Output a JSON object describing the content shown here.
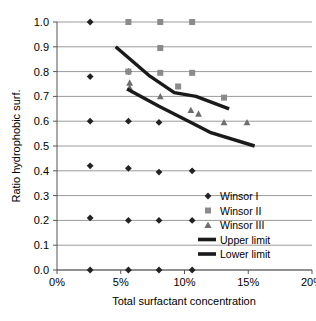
{
  "chart_data": {
    "type": "scatter",
    "title": "",
    "xlabel": "Total surfactant concentration",
    "ylabel": "Ratio hydrophobic surf.",
    "xlim": [
      0,
      20
    ],
    "ylim": [
      0.0,
      1.0
    ],
    "xticks": [
      "0%",
      "5%",
      "10%",
      "15%",
      "20%"
    ],
    "xtick_values": [
      0,
      5,
      10,
      15,
      20
    ],
    "yticks": [
      "0.0",
      "0.1",
      "0.2",
      "0.3",
      "0.4",
      "0.5",
      "0.6",
      "0.7",
      "0.8",
      "0.9",
      "1.0"
    ],
    "ytick_values": [
      0.0,
      0.1,
      0.2,
      0.3,
      0.4,
      0.5,
      0.6,
      0.7,
      0.8,
      0.9,
      1.0
    ],
    "grid": true,
    "legend_position": "inside-bottom-right",
    "series": [
      {
        "name": "Winsor I",
        "marker": "diamond",
        "color": "#222222",
        "points": [
          [
            2.6,
            1.0
          ],
          [
            2.6,
            0.78
          ],
          [
            2.6,
            0.6
          ],
          [
            2.6,
            0.42
          ],
          [
            2.6,
            0.21
          ],
          [
            2.6,
            0.0
          ],
          [
            5.6,
            0.8
          ],
          [
            5.6,
            0.6
          ],
          [
            5.6,
            0.41
          ],
          [
            5.6,
            0.2
          ],
          [
            5.6,
            0.0
          ],
          [
            8.0,
            0.595
          ],
          [
            8.0,
            0.395
          ],
          [
            8.0,
            0.2
          ],
          [
            8.0,
            0.0
          ],
          [
            10.6,
            0.4
          ],
          [
            10.6,
            0.2
          ],
          [
            10.6,
            0.0
          ]
        ]
      },
      {
        "name": "Winsor II",
        "marker": "square",
        "color": "#8a8a8a",
        "points": [
          [
            5.6,
            1.0
          ],
          [
            8.1,
            1.0
          ],
          [
            10.6,
            1.0
          ],
          [
            8.1,
            0.895
          ],
          [
            5.6,
            0.8
          ],
          [
            8.1,
            0.795
          ],
          [
            10.6,
            0.795
          ],
          [
            9.5,
            0.74
          ],
          [
            13.1,
            0.695
          ]
        ]
      },
      {
        "name": "Winsor III",
        "marker": "triangle",
        "color": "#6e6e6e",
        "points": [
          [
            5.7,
            0.755
          ],
          [
            5.7,
            0.735
          ],
          [
            8.1,
            0.7
          ],
          [
            10.5,
            0.645
          ],
          [
            11.1,
            0.63
          ],
          [
            13.1,
            0.595
          ],
          [
            14.9,
            0.595
          ]
        ]
      },
      {
        "name": "Upper limit",
        "marker": "line",
        "color": "#1a1a1a",
        "points": [
          [
            4.6,
            0.9
          ],
          [
            7.2,
            0.785
          ],
          [
            9.2,
            0.715
          ],
          [
            10.9,
            0.7
          ],
          [
            13.5,
            0.65
          ]
        ]
      },
      {
        "name": "Lower limit",
        "marker": "line",
        "color": "#1a1a1a",
        "points": [
          [
            5.5,
            0.73
          ],
          [
            8.0,
            0.66
          ],
          [
            10.7,
            0.59
          ],
          [
            12.0,
            0.555
          ],
          [
            15.5,
            0.5
          ]
        ]
      }
    ],
    "legend": [
      {
        "label": "Winsor I",
        "marker": "diamond"
      },
      {
        "label": "Winsor II",
        "marker": "square"
      },
      {
        "label": "Winsor III",
        "marker": "triangle"
      },
      {
        "label": "Upper limit",
        "marker": "line"
      },
      {
        "label": "Lower limit",
        "marker": "line"
      }
    ],
    "colors": {
      "winsor_i": "#222222",
      "winsor_ii": "#8a8a8a",
      "winsor_iii": "#6e6e6e",
      "limit_line": "#1a1a1a",
      "grid": "#9a9a9a",
      "axis": "#555555",
      "background": "#ffffff"
    }
  }
}
